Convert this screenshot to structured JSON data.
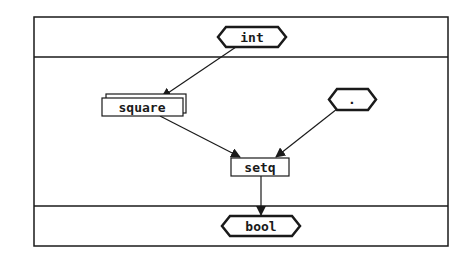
{
  "diagram": {
    "type": "dataflow",
    "sections": [
      "input",
      "body",
      "output"
    ],
    "nodes": [
      {
        "id": "int",
        "label": "int",
        "shape": "hexagon",
        "role": "input-type"
      },
      {
        "id": "square",
        "label": "square",
        "shape": "stacked-box",
        "role": "function"
      },
      {
        "id": "dot",
        "label": ".",
        "shape": "hexagon",
        "role": "constant"
      },
      {
        "id": "setq",
        "label": "setq",
        "shape": "box",
        "role": "function"
      },
      {
        "id": "bool",
        "label": "bool",
        "shape": "hexagon",
        "role": "output-type"
      }
    ],
    "edges": [
      {
        "from": "int",
        "to": "square"
      },
      {
        "from": "square",
        "to": "setq"
      },
      {
        "from": "dot",
        "to": "setq"
      },
      {
        "from": "setq",
        "to": "bool"
      }
    ]
  },
  "colors": {
    "stroke": "#1a1a1a",
    "background": "#ffffff"
  }
}
